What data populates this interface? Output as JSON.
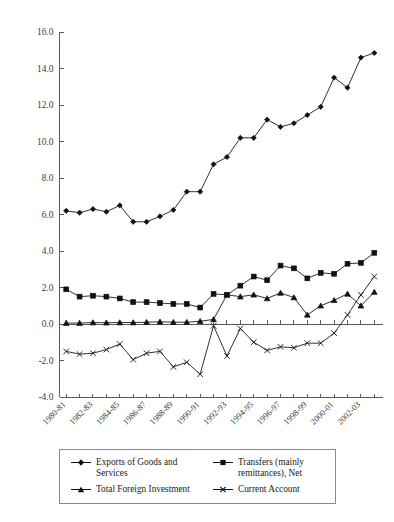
{
  "chart_data": {
    "type": "line",
    "title": "",
    "subtitle": "",
    "xlabel": "",
    "ylabel": "",
    "ylim": [
      -4.0,
      16.0
    ],
    "ytick_step": 2.0,
    "yticks": [
      "16.0",
      "14.0",
      "12.0",
      "10.0",
      "8.0",
      "6.0",
      "4.0",
      "2.0",
      "0.0",
      "-2.0",
      "-4.0"
    ],
    "grid": false,
    "legend_position": "bottom",
    "x": [
      "1980-81",
      "1981-82",
      "1982-83",
      "1983-84",
      "1984-85",
      "1985-86",
      "1986-87",
      "1987-88",
      "1988-89",
      "1989-90",
      "1990-91",
      "1991-92",
      "1992-93",
      "1993-94",
      "1994-95",
      "1995-96",
      "1996-97",
      "1997-98",
      "1998-99",
      "1999-00",
      "2000-01",
      "2001-02",
      "2002-03",
      "2003-04"
    ],
    "xtick_labels_shown": [
      "1980-81",
      "1982-83",
      "1984-85",
      "1986-87",
      "1988-89",
      "1990-91",
      "1992-93",
      "1994-95",
      "1996-97",
      "1998-99",
      "2000-01",
      "2002-03"
    ],
    "series": [
      {
        "name": "Exports of Goods and Services",
        "marker": "diamond",
        "values": [
          6.2,
          6.1,
          6.3,
          6.15,
          6.5,
          5.6,
          5.6,
          5.9,
          6.25,
          7.25,
          7.25,
          8.75,
          9.15,
          10.2,
          10.2,
          11.2,
          10.8,
          11.0,
          11.45,
          11.9,
          13.5,
          12.95,
          14.6,
          14.85
        ]
      },
      {
        "name": "Transfers (mainly remittances), Net",
        "marker": "square",
        "values": [
          1.9,
          1.5,
          1.55,
          1.5,
          1.4,
          1.2,
          1.2,
          1.15,
          1.1,
          1.1,
          0.9,
          1.65,
          1.6,
          2.1,
          2.6,
          2.4,
          3.2,
          3.05,
          2.5,
          2.8,
          2.75,
          3.3,
          3.35,
          3.9
        ]
      },
      {
        "name": "Total Foreign Investment",
        "marker": "triangle",
        "values": [
          0.05,
          0.05,
          0.08,
          0.07,
          0.08,
          0.08,
          0.1,
          0.12,
          0.1,
          0.1,
          0.15,
          0.25,
          1.6,
          1.5,
          1.6,
          1.4,
          1.7,
          1.45,
          0.5,
          1.0,
          1.3,
          1.65,
          1.0,
          1.75
        ]
      },
      {
        "name": "Current Account",
        "marker": "cross",
        "values": [
          -1.5,
          -1.65,
          -1.6,
          -1.4,
          -1.1,
          -1.95,
          -1.6,
          -1.5,
          -2.35,
          -2.1,
          -2.75,
          -0.1,
          -1.75,
          -0.25,
          -1.0,
          -1.45,
          -1.25,
          -1.3,
          -1.05,
          -1.05,
          -0.5,
          0.5,
          1.6,
          2.6
        ]
      }
    ]
  },
  "legend": {
    "items": [
      {
        "label": "Exports of Goods and Services",
        "marker": "diamond"
      },
      {
        "label": "Transfers (mainly remittances), Net",
        "marker": "square"
      },
      {
        "label": "Total Foreign Investment",
        "marker": "triangle"
      },
      {
        "label": "Current Account",
        "marker": "cross"
      }
    ]
  }
}
